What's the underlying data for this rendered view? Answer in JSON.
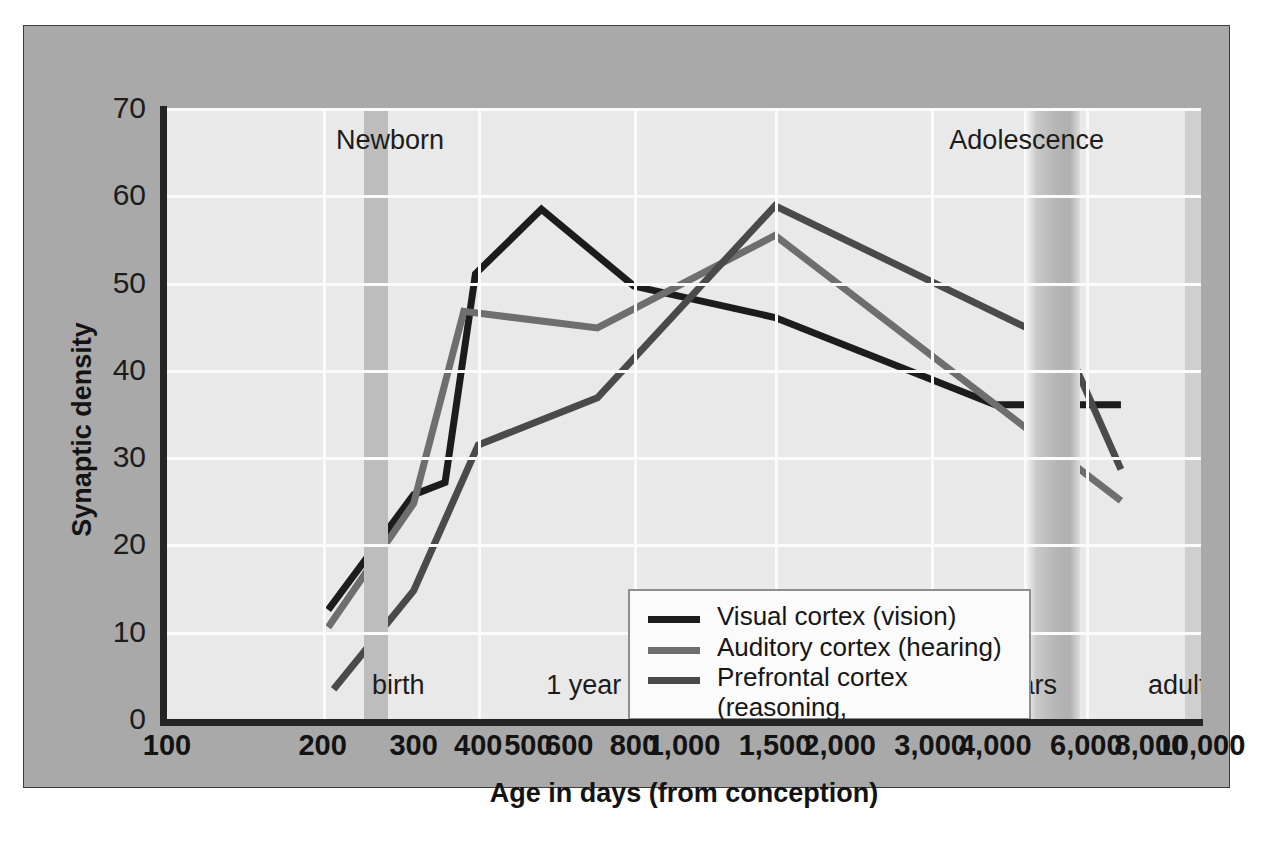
{
  "chart_data": {
    "type": "line",
    "title": "",
    "xlabel": "Age in days (from conception)",
    "ylabel": "Synaptic density",
    "xscale": "log",
    "x_tick_labels": [
      "100",
      "200",
      "300",
      "400",
      "500",
      "600",
      "800",
      "1,000",
      "1,500",
      "2,000",
      "3,000",
      "4,000",
      "6,000",
      "8,000",
      "10,000"
    ],
    "x_tick_values": [
      100,
      200,
      300,
      400,
      500,
      600,
      800,
      1000,
      1500,
      2000,
      3000,
      4000,
      6000,
      8000,
      10000
    ],
    "y_tick_labels": [
      "0",
      "10",
      "20",
      "30",
      "40",
      "50",
      "60",
      "70"
    ],
    "ylim": [
      0,
      70
    ],
    "xlim": [
      100,
      10000
    ],
    "grid": true,
    "legend_position": "center",
    "stage_annotations": [
      {
        "label": "birth",
        "x": 280
      },
      {
        "label": "1 year",
        "x": 640
      },
      {
        "label": "3 years",
        "x": 1300
      },
      {
        "label": "11 years",
        "x": 4200
      },
      {
        "label": "adult",
        "x": 9000
      }
    ],
    "era_annotations": [
      {
        "label": "Newborn",
        "x": 270
      },
      {
        "label": "Adolescence",
        "x": 4600
      }
    ],
    "shaded_bands": [
      {
        "name": "birth-band",
        "x0": 275,
        "x1": 300
      },
      {
        "name": "adolescence-band",
        "x0": 4400,
        "x1": 6100
      }
    ],
    "series": [
      {
        "name": "Visual cortex (vision)",
        "color": "#1c1c1c",
        "x": [
          205,
          300,
          345,
          395,
          530,
          800,
          1500,
          4000,
          7000
        ],
        "y": [
          12.5,
          25.7,
          27.1,
          51.0,
          58.4,
          49.6,
          46.0,
          36.0,
          36.0
        ]
      },
      {
        "name": "Auditory cortex (hearing)",
        "color": "#6e6e6e",
        "x": [
          205,
          300,
          375,
          680,
          1500,
          7000
        ],
        "y": [
          10.5,
          24.7,
          46.7,
          44.8,
          55.4,
          25.0
        ]
      },
      {
        "name": "Prefrontal cortex (reasoning, self-regulation)",
        "color": "#4a4a4a",
        "x": [
          210,
          300,
          400,
          680,
          1500,
          5500,
          7000
        ],
        "y": [
          3.4,
          14.7,
          31.4,
          36.8,
          58.8,
          42.6,
          28.6
        ]
      }
    ]
  },
  "legend": {
    "items": [
      {
        "label": "Visual cortex (vision)",
        "color": "#1c1c1c"
      },
      {
        "label": "Auditory cortex (hearing)",
        "color": "#6e6e6e"
      },
      {
        "label": "Prefrontal cortex (reasoning,\nself-regulation)",
        "color": "#4a4a4a"
      }
    ]
  },
  "axes": {
    "x_title": "Age in days (from conception)",
    "y_title": "Synaptic density"
  }
}
